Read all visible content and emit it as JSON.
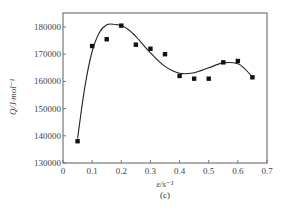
{
  "chart_data": {
    "type": "scatter",
    "title": "",
    "panel_label": "(c)",
    "xlabel": "ε/s⁻¹",
    "ylabel": "Q/J·mol⁻¹",
    "xlim": [
      0,
      0.7
    ],
    "ylim": [
      130000,
      185000
    ],
    "grid": false,
    "legend": null,
    "x_ticks": [
      0,
      0.1,
      0.2,
      0.3,
      0.4,
      0.5,
      0.6,
      0.7
    ],
    "x_tick_labels": [
      "0",
      "0.1",
      "0.2",
      "0.3",
      "0.4",
      "0.5",
      "0.6",
      "0.7"
    ],
    "y_ticks": [
      130000,
      140000,
      150000,
      160000,
      170000,
      180000
    ],
    "y_tick_labels": [
      "130000",
      "140000",
      "150000",
      "160000",
      "170000",
      "180000"
    ],
    "series": [
      {
        "name": "measured",
        "marker": "square",
        "color": "#111111",
        "x": [
          0.05,
          0.1,
          0.15,
          0.2,
          0.25,
          0.3,
          0.35,
          0.4,
          0.45,
          0.5,
          0.55,
          0.6,
          0.65
        ],
        "y": [
          138000,
          173000,
          175500,
          180500,
          173500,
          172000,
          170000,
          162000,
          161000,
          161000,
          167000,
          167500,
          161500
        ]
      },
      {
        "name": "fit curve",
        "type": "line",
        "color": "#222222",
        "x": [
          0.05,
          0.075,
          0.1,
          0.125,
          0.15,
          0.175,
          0.2,
          0.225,
          0.25,
          0.3,
          0.35,
          0.4,
          0.45,
          0.5,
          0.55,
          0.6,
          0.625,
          0.65
        ],
        "y": [
          139000,
          158000,
          171000,
          178000,
          180800,
          181000,
          180500,
          179000,
          176500,
          170500,
          165500,
          163000,
          163200,
          165000,
          166800,
          166500,
          164500,
          161500
        ]
      }
    ]
  }
}
